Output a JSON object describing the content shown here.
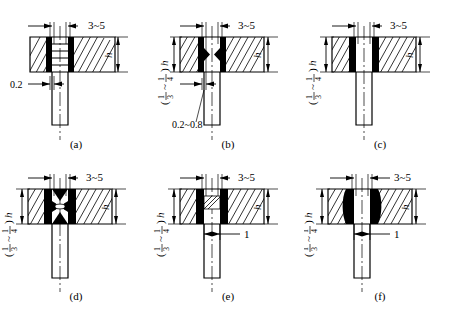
{
  "figure": {
    "panel_count": 6,
    "line_color": "#000000",
    "weld_fill_color": "#000000",
    "background_color": "#ffffff"
  },
  "labels": {
    "gap": "3~5",
    "height": "h",
    "fraction": "( ⅓ ~ ¼ )h",
    "fraction_num1": "1",
    "fraction_den1": "3",
    "fraction_num2": "1",
    "fraction_den2": "4",
    "fraction_suffix": "h",
    "root_a": "0.2",
    "root_b": "0.2~0.8",
    "offset_one": "1"
  },
  "panels": [
    {
      "id": "a",
      "caption": "(a)",
      "weld_style": "layered-straight",
      "dims": [
        "3~5",
        "h",
        "0.2"
      ]
    },
    {
      "id": "b",
      "caption": "(b)",
      "weld_style": "pointed-taper",
      "dims": [
        "3~5",
        "h",
        "( ⅓ ~ ¼ )h",
        "0.2~0.8"
      ]
    },
    {
      "id": "c",
      "caption": "(c)",
      "weld_style": "rectangular-block",
      "dims": [
        "3~5",
        "h",
        "( ⅓ ~ ¼ )h"
      ]
    },
    {
      "id": "d",
      "caption": "(d)",
      "weld_style": "hourglass-bowtie",
      "dims": [
        "3~5",
        "h",
        "( ⅓ ~ ¼ )h"
      ]
    },
    {
      "id": "e",
      "caption": "(e)",
      "weld_style": "diagonal-hatched-bead",
      "dims": [
        "3~5",
        "h",
        "( ⅓ ~ ¼ )h",
        "1"
      ]
    },
    {
      "id": "f",
      "caption": "(f)",
      "weld_style": "oval-bulge",
      "dims": [
        "3~5",
        "h",
        "( ⅓ ~ ¼ )h",
        "1"
      ]
    }
  ]
}
